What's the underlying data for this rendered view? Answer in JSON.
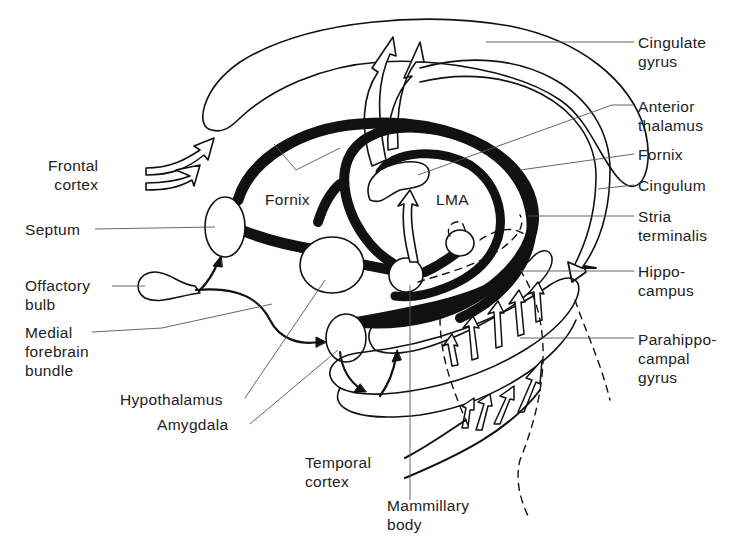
{
  "figure": {
    "colors": {
      "ink": "#111111",
      "background": "#ffffff",
      "label_text": "#222222",
      "leader_line": "#555555"
    }
  },
  "labels": {
    "frontal_cortex": "Frontal\ncortex",
    "septum": "Septum",
    "olfactory_bulb": "Offactory\nbulb",
    "medial_forebrain_bundle": "Medial\nforebrain\nbundle",
    "hypothalamus": "Hypothalamus",
    "amygdala": "Amygdala",
    "temporal_cortex": "Temporal\ncortex",
    "mammillary_body": "Mammillary\nbody",
    "fornix_inner": "Fornix",
    "lma": "LMA",
    "cingulate_gyrus": "Cingulate\ngyrus",
    "anterior_thalamus": "Anterior\nthalamus",
    "fornix": "Fornix",
    "cingulum": "Cingulum",
    "stria_terminalis": "Stria\nterminalis",
    "hippocampus": "Hippo-\ncampus",
    "parahippocampal_gyrus": "Parahippo-\ncampal\ngyrus"
  }
}
